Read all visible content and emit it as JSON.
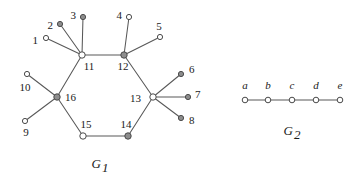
{
  "figure": {
    "background_color": "#ffffff",
    "edge_color": "#585858",
    "node_open_fill": "#ffffff",
    "node_filled_fill": "#8d8d8d",
    "node_stroke": "#4a4a4a"
  },
  "graphs": [
    {
      "id": "G1",
      "caption_name": "G",
      "caption_sub": "1",
      "caption_x": 100,
      "caption_y": 168,
      "nodes": [
        {
          "id": "1",
          "label": "1",
          "x": 46,
          "y": 38,
          "r": 2.6,
          "fill": "open",
          "label_x": 38,
          "label_y": 41,
          "label_anchor": "end"
        },
        {
          "id": "2",
          "label": "2",
          "x": 60,
          "y": 24,
          "r": 2.6,
          "fill": "filled",
          "label_x": 53,
          "label_y": 26,
          "label_anchor": "end"
        },
        {
          "id": "3",
          "label": "3",
          "x": 83,
          "y": 17,
          "r": 2.6,
          "fill": "filled",
          "label_x": 76,
          "label_y": 16,
          "label_anchor": "end"
        },
        {
          "id": "4",
          "label": "4",
          "x": 129,
          "y": 17,
          "r": 2.6,
          "fill": "open",
          "label_x": 122,
          "label_y": 16,
          "label_anchor": "end"
        },
        {
          "id": "5",
          "label": "5",
          "x": 160,
          "y": 37,
          "r": 2.6,
          "fill": "open",
          "label_x": 159,
          "label_y": 27,
          "label_anchor": "middle"
        },
        {
          "id": "6",
          "label": "6",
          "x": 181,
          "y": 74,
          "r": 2.6,
          "fill": "filled",
          "label_x": 189,
          "label_y": 70,
          "label_anchor": "start"
        },
        {
          "id": "7",
          "label": "7",
          "x": 188,
          "y": 97,
          "r": 2.6,
          "fill": "filled",
          "label_x": 195,
          "label_y": 95,
          "label_anchor": "start"
        },
        {
          "id": "8",
          "label": "8",
          "x": 181,
          "y": 118,
          "r": 2.6,
          "fill": "filled",
          "label_x": 189,
          "label_y": 121,
          "label_anchor": "start"
        },
        {
          "id": "9",
          "label": "9",
          "x": 25,
          "y": 121,
          "r": 2.6,
          "fill": "open",
          "label_x": 26,
          "label_y": 133,
          "label_anchor": "middle"
        },
        {
          "id": "10",
          "label": "10",
          "x": 27,
          "y": 74,
          "r": 2.6,
          "fill": "open",
          "label_x": 25,
          "label_y": 88,
          "label_anchor": "middle"
        },
        {
          "id": "11",
          "label": "11",
          "x": 82,
          "y": 55,
          "r": 3.2,
          "fill": "open",
          "label_x": 89,
          "label_y": 67,
          "label_anchor": "middle"
        },
        {
          "id": "12",
          "label": "12",
          "x": 124,
          "y": 55,
          "r": 3.2,
          "fill": "filled",
          "label_x": 123,
          "label_y": 67,
          "label_anchor": "middle"
        },
        {
          "id": "13",
          "label": "13",
          "x": 153,
          "y": 97,
          "r": 3.2,
          "fill": "open",
          "label_x": 141,
          "label_y": 99,
          "label_anchor": "end"
        },
        {
          "id": "14",
          "label": "14",
          "x": 128,
          "y": 136,
          "r": 3.2,
          "fill": "filled",
          "label_x": 126,
          "label_y": 125,
          "label_anchor": "middle"
        },
        {
          "id": "15",
          "label": "15",
          "x": 83,
          "y": 136,
          "r": 3.2,
          "fill": "open",
          "label_x": 86,
          "label_y": 125,
          "label_anchor": "middle"
        },
        {
          "id": "16",
          "label": "16",
          "x": 57,
          "y": 97,
          "r": 3.2,
          "fill": "filled",
          "label_x": 65,
          "label_y": 98,
          "label_anchor": "start"
        }
      ],
      "edges": [
        {
          "from": "11",
          "to": "12"
        },
        {
          "from": "12",
          "to": "13"
        },
        {
          "from": "13",
          "to": "14"
        },
        {
          "from": "14",
          "to": "15"
        },
        {
          "from": "15",
          "to": "16"
        },
        {
          "from": "16",
          "to": "11"
        },
        {
          "from": "11",
          "to": "1"
        },
        {
          "from": "11",
          "to": "2"
        },
        {
          "from": "11",
          "to": "3"
        },
        {
          "from": "12",
          "to": "4"
        },
        {
          "from": "12",
          "to": "5"
        },
        {
          "from": "13",
          "to": "6"
        },
        {
          "from": "13",
          "to": "7"
        },
        {
          "from": "13",
          "to": "8"
        },
        {
          "from": "16",
          "to": "9"
        },
        {
          "from": "16",
          "to": "10"
        }
      ]
    },
    {
      "id": "G2",
      "caption_name": "G",
      "caption_sub": "2",
      "caption_x": 292,
      "caption_y": 135,
      "nodes": [
        {
          "id": "a",
          "label": "a",
          "x": 245,
          "y": 100,
          "r": 2.8,
          "fill": "open",
          "label_x": 245,
          "label_y": 86,
          "label_anchor": "middle"
        },
        {
          "id": "b",
          "label": "b",
          "x": 268,
          "y": 100,
          "r": 2.8,
          "fill": "open",
          "label_x": 268,
          "label_y": 86,
          "label_anchor": "middle"
        },
        {
          "id": "c",
          "label": "c",
          "x": 292,
          "y": 100,
          "r": 2.8,
          "fill": "open",
          "label_x": 292,
          "label_y": 86,
          "label_anchor": "middle"
        },
        {
          "id": "d",
          "label": "d",
          "x": 316,
          "y": 100,
          "r": 2.8,
          "fill": "open",
          "label_x": 316,
          "label_y": 86,
          "label_anchor": "middle"
        },
        {
          "id": "e",
          "label": "e",
          "x": 340,
          "y": 100,
          "r": 2.8,
          "fill": "open",
          "label_x": 340,
          "label_y": 86,
          "label_anchor": "middle"
        }
      ],
      "edges": [
        {
          "from": "a",
          "to": "b"
        },
        {
          "from": "b",
          "to": "c"
        },
        {
          "from": "c",
          "to": "d"
        },
        {
          "from": "d",
          "to": "e"
        }
      ]
    }
  ]
}
